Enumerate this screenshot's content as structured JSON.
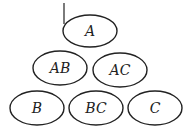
{
  "diagram": {
    "nodes": [
      {
        "id": "A",
        "label": "A",
        "cx": 90,
        "cy": 31,
        "rx": 27,
        "ry": 16
      },
      {
        "id": "AB",
        "label": "AB",
        "cx": 60,
        "cy": 68,
        "rx": 27,
        "ry": 17
      },
      {
        "id": "AC",
        "label": "AC",
        "cx": 120,
        "cy": 70,
        "rx": 27,
        "ry": 17
      },
      {
        "id": "B",
        "label": "B",
        "cx": 37,
        "cy": 108,
        "rx": 27,
        "ry": 17
      },
      {
        "id": "BC",
        "label": "BC",
        "cx": 96,
        "cy": 108,
        "rx": 27,
        "ry": 17
      },
      {
        "id": "C",
        "label": "C",
        "cx": 155,
        "cy": 108,
        "rx": 27,
        "ry": 17
      }
    ],
    "marks": [
      {
        "type": "line",
        "x1": 64,
        "y1": 3,
        "x2": 64,
        "y2": 24
      }
    ]
  }
}
